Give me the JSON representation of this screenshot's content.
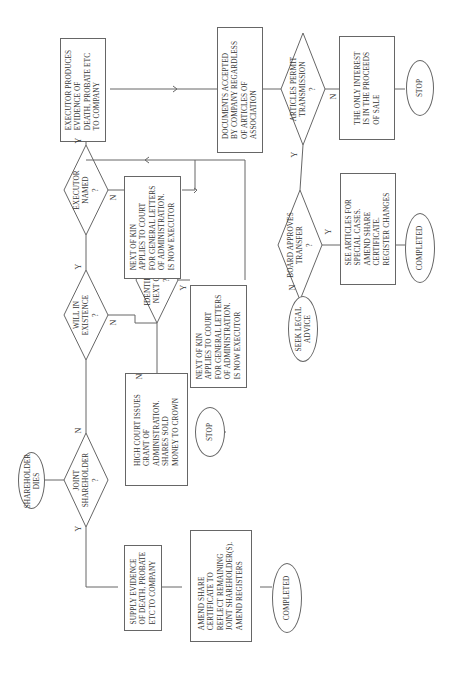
{
  "flowchart": {
    "orientation": "rotated-90-ccw",
    "start": "SHAREHOLDER\nDIES",
    "decisions": {
      "joint": "JOINT\nSHAREHOLDER\n?",
      "will": "WILL IN\nEXISTENCE\n?",
      "executor": "EXECUTOR\nNAMED\n?",
      "kin": "IDENTIFIABLE\nNEXT OF KIN\n?",
      "articles": "ARTICLES PERMIT\nTRANSMISSION\n?",
      "board": "BOARD APPROVES\nTRANSFER\n?"
    },
    "processes": {
      "supply_evidence": "SUPPLY EVIDENCE\nOF DEATH, PROBATE\nETC TO COMPANY",
      "amend_certificate": "AMEND SHARE\nCERTIFICATE TO\nREFLECT REMAINING\nJOINT SHAREHOLDER(S).\nAMEND REGISTERS",
      "high_court": "HIGH COURT ISSUES\nGRANT OF\nADMINISTRATION.\nSHARES SOLD\nMONEY TO CROWN",
      "kin_applies_1": "NEXT OF KIN\nAPPLIES TO COURT\nFOR GENERAL LETTERS\nOF ADMINISTRATION.\nIS NOW EXECUTOR",
      "kin_applies_2": "NEXT OF KIN\nAPPLIES TO COURT\nFOR GENERAL LETTERS\nOF ADMINISTRATION.\nIS NOW EXECUTOR",
      "executor_produces": "EXECUTOR PRODUCES\nEVIDENCE OF\nDEATH, PROBATE ETC\nTO COMPANY",
      "documents_accepted": "DOCUMENTS ACCEPTED\nBY COMPANY REGARDLESS\nOF ARTICLES OF\nASSOCIATION",
      "only_interest": "THE ONLY INTEREST\nIS IN THE PROCEEDS\nOF SALE",
      "see_articles": "SEE ARTICLES FOR\nSPECIAL CASES.\nAMEND SHARE\nCERTIFICATE.\nREGISTER CHANGES"
    },
    "terminals": {
      "completed_1": "COMPLETED",
      "stop_1": "STOP",
      "stop_2": "STOP",
      "completed_2": "COMPLETED",
      "seek_legal": "SEEK LEGAL\nADVICE"
    },
    "labels": {
      "yes": "Y",
      "no": "N"
    }
  }
}
